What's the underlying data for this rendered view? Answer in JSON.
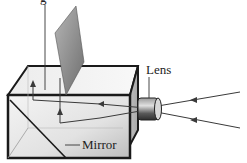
{
  "diagram": {
    "labels": {
      "top_partial": "g",
      "lens": "Lens",
      "mirror": "Mirror"
    },
    "components": [
      "box",
      "viewing-screen",
      "mirror",
      "lens",
      "light-rays"
    ],
    "colors": {
      "box_outline": "#1a1a1a",
      "box_face": "#e8e8e8",
      "screen": "#8a8a8a",
      "ray": "#3a3a3a",
      "lens": "#555555"
    }
  }
}
